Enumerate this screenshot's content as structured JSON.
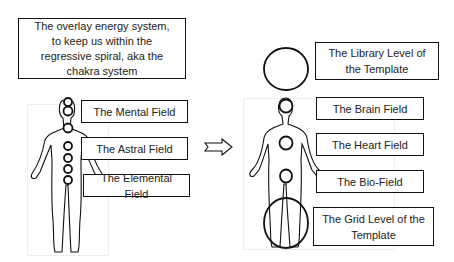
{
  "title_box": {
    "text": "The overlay energy system, to keep us within the regressive spiral, aka the chakra system"
  },
  "left_figure": {
    "label": "chakra-system-figure",
    "fields": [
      {
        "label": "The Mental Field"
      },
      {
        "label": "The Astral Field"
      },
      {
        "label": "The Elemental Field"
      }
    ],
    "chakra_count": 7
  },
  "arrow": {
    "direction": "right",
    "symbol": "⇨"
  },
  "right_figure": {
    "label": "template-figure",
    "fields": [
      {
        "label": "The Library Level of the Template"
      },
      {
        "label": "The Brain Field"
      },
      {
        "label": "The Heart Field"
      },
      {
        "label": "The Bio-Field"
      },
      {
        "label": "The Grid Level of the Template"
      }
    ]
  },
  "colors": {
    "stroke": "#111111",
    "background": "#ffffff"
  }
}
